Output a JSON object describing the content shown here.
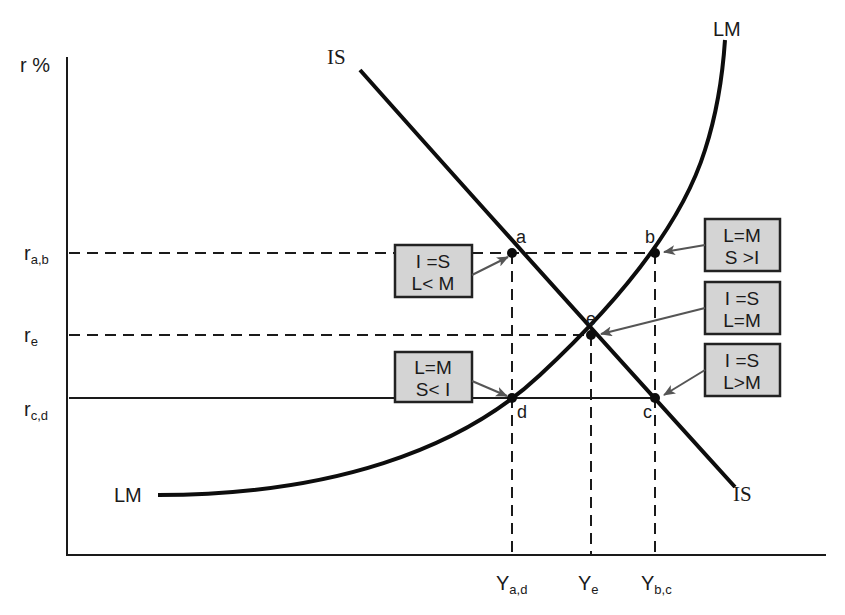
{
  "diagram": {
    "y_axis_label": "r %",
    "x_axis_label": "",
    "y_ticks": [
      {
        "main": "r",
        "sub": "a,b"
      },
      {
        "main": "r",
        "sub": "e"
      },
      {
        "main": "r",
        "sub": "c,d"
      }
    ],
    "x_ticks": [
      {
        "main": "Y",
        "sub": "a,d"
      },
      {
        "main": "Y",
        "sub": "e"
      },
      {
        "main": "Y",
        "sub": "b,c"
      }
    ],
    "curves": {
      "is_top_label": "IS",
      "is_bottom_label": "IS",
      "lm_top_label": "LM",
      "lm_bottom_label": "LM"
    },
    "points": [
      {
        "id": "a",
        "label": "a"
      },
      {
        "id": "b",
        "label": "b"
      },
      {
        "id": "e",
        "label": "e"
      },
      {
        "id": "d",
        "label": "d"
      },
      {
        "id": "c",
        "label": "c"
      }
    ],
    "boxes": [
      {
        "id": "box-a",
        "line1": "I =S",
        "line2": "L< M",
        "points_to": "a"
      },
      {
        "id": "box-b",
        "line1": "L=M",
        "line2": "S >I",
        "points_to": "b"
      },
      {
        "id": "box-e",
        "line1": "I =S",
        "line2": "L=M",
        "points_to": "e"
      },
      {
        "id": "box-c",
        "line1": "I =S",
        "line2": "L>M",
        "points_to": "c"
      },
      {
        "id": "box-d",
        "line1": "L=M",
        "line2": "S< I",
        "points_to": "d"
      }
    ],
    "colors": {
      "line": "#1a1a1a",
      "box_fill": "#d4d4d4",
      "arrow": "#555555"
    }
  }
}
